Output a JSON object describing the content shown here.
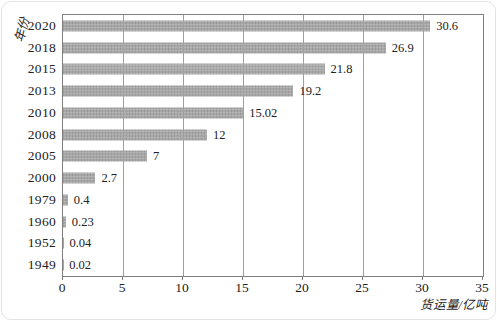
{
  "chart_data": {
    "type": "bar",
    "orientation": "horizontal",
    "title": "",
    "ylabel": "年份",
    "xlabel": "货运量/亿吨",
    "categories": [
      "2020",
      "2018",
      "2015",
      "2013",
      "2010",
      "2008",
      "2005",
      "2000",
      "1979",
      "1960",
      "1952",
      "1949"
    ],
    "values": [
      30.6,
      26.9,
      21.8,
      19.2,
      15.02,
      12,
      7,
      2.7,
      0.4,
      0.23,
      0.04,
      0.02
    ],
    "value_labels": [
      "30.6",
      "26.9",
      "21.8",
      "19.2",
      "15.02",
      "12",
      "7",
      "2.7",
      "0.4",
      "0.23",
      "0.04",
      "0.02"
    ],
    "xlim": [
      0,
      35
    ],
    "xticks": [
      0,
      5,
      10,
      15,
      20,
      25,
      30,
      35
    ],
    "grid": "vertical",
    "legend": "none",
    "bar_color": "#a7a7a7",
    "frame_color": "#7f7f7f",
    "gridline_color": "#9f9f9f",
    "text_color": "#222222"
  }
}
